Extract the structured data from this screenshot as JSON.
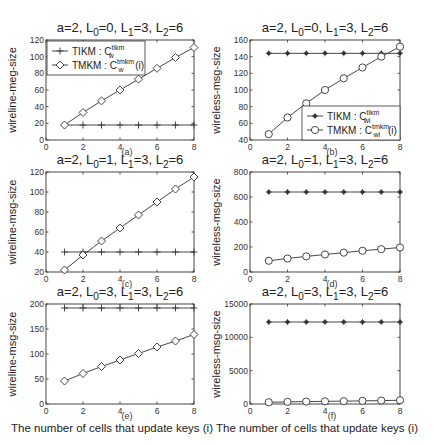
{
  "figure": {
    "xlabel": "The number of cells that update keys (i)"
  },
  "chart_data": [
    {
      "panel": "(a)",
      "type": "line",
      "title": "a=2, L0=0, L1=3, L2=6",
      "title_parts": {
        "a": "a=2, L",
        "s0": "0",
        "p0": "=0, L",
        "s1": "1",
        "p1": "=3, L",
        "s2": "2",
        "p2": "=6"
      },
      "xlabel": "",
      "ylabel": "wireline-meg-size",
      "x": [
        1,
        2,
        3,
        4,
        5,
        6,
        7,
        8
      ],
      "xlim": [
        0,
        8
      ],
      "ylim": [
        0,
        120
      ],
      "xticks": [
        0,
        2,
        4,
        6,
        8
      ],
      "yticks": [
        0,
        20,
        40,
        60,
        80,
        100,
        120
      ],
      "legend": {
        "position": "upper left",
        "entries": [
          "TIKM : C_w^tikm",
          "TMKM : C_w^tmkm(i)"
        ]
      },
      "series": [
        {
          "name": "TIKM : C_w^tikm",
          "marker": "plus",
          "values": [
            18,
            18,
            18,
            18,
            18,
            18,
            18,
            18
          ]
        },
        {
          "name": "TMKM : C_w^tmkm(i)",
          "marker": "diamond",
          "values": [
            18,
            33,
            47,
            60,
            73,
            86,
            99,
            111
          ]
        }
      ]
    },
    {
      "panel": "(b)",
      "type": "line",
      "title": "a=2, L0=0, L1=3, L2=6",
      "title_parts": {
        "a": "a=2, L",
        "s0": "0",
        "p0": "=0, L",
        "s1": "1",
        "p1": "=3, L",
        "s2": "2",
        "p2": "=6"
      },
      "xlabel": "",
      "ylabel": "wireless-msg-size",
      "x": [
        1,
        2,
        3,
        4,
        5,
        6,
        7,
        8
      ],
      "xlim": [
        0,
        8
      ],
      "ylim": [
        40,
        160
      ],
      "xticks": [
        0,
        2,
        4,
        6,
        8
      ],
      "yticks": [
        40,
        60,
        80,
        100,
        120,
        140,
        160
      ],
      "legend": {
        "position": "lower right",
        "entries": [
          "TIKM : C_wl^tikm",
          "TMKM : C_wl^tmkm(i)"
        ]
      },
      "series": [
        {
          "name": "TIKM : C_wl^tikm",
          "marker": "star",
          "values": [
            144,
            144,
            144,
            144,
            144,
            144,
            144,
            144
          ]
        },
        {
          "name": "TMKM : C_wl^tmkm(i)",
          "marker": "circle",
          "values": [
            47,
            67,
            84,
            100,
            114,
            127,
            140,
            152
          ]
        }
      ]
    },
    {
      "panel": "(c)",
      "type": "line",
      "title": "a=2, L0=1, L1=3, L2=6",
      "title_parts": {
        "a": "a=2, L",
        "s0": "0",
        "p0": "=1, L",
        "s1": "1",
        "p1": "=3, L",
        "s2": "2",
        "p2": "=6"
      },
      "xlabel": "",
      "ylabel": "wireline-msg-size",
      "x": [
        1,
        2,
        3,
        4,
        5,
        6,
        7,
        8
      ],
      "xlim": [
        0,
        8
      ],
      "ylim": [
        20,
        120
      ],
      "xticks": [
        0,
        2,
        4,
        6,
        8
      ],
      "yticks": [
        20,
        40,
        60,
        80,
        100,
        120
      ],
      "series": [
        {
          "name": "TIKM : C_w^tikm",
          "marker": "plus",
          "values": [
            40,
            40,
            40,
            40,
            40,
            40,
            40,
            40
          ]
        },
        {
          "name": "TMKM : C_w^tmkm(i)",
          "marker": "diamond",
          "values": [
            22,
            37,
            51,
            64,
            77,
            90,
            103,
            115
          ]
        }
      ]
    },
    {
      "panel": "(d)",
      "type": "line",
      "title": "a=2, L0=1, L1=3, L2=6",
      "title_parts": {
        "a": "a=2, L",
        "s0": "0",
        "p0": "=1, L",
        "s1": "1",
        "p1": "=3, L",
        "s2": "2",
        "p2": "=6"
      },
      "xlabel": "",
      "ylabel": "wireless-msg-size",
      "x": [
        1,
        2,
        3,
        4,
        5,
        6,
        7,
        8
      ],
      "xlim": [
        0,
        8
      ],
      "ylim": [
        0,
        800
      ],
      "xticks": [
        0,
        2,
        4,
        6,
        8
      ],
      "yticks": [
        0,
        200,
        400,
        600,
        800
      ],
      "series": [
        {
          "name": "TIKM : C_wl^tikm",
          "marker": "star",
          "values": [
            640,
            640,
            640,
            640,
            640,
            640,
            640,
            640
          ]
        },
        {
          "name": "TMKM : C_wl^tmkm(i)",
          "marker": "circle",
          "values": [
            90,
            108,
            125,
            140,
            155,
            170,
            183,
            196
          ]
        }
      ]
    },
    {
      "panel": "(e)",
      "type": "line",
      "title": "a=2, L0=3, L1=3, L2=6",
      "title_parts": {
        "a": "a=2, L",
        "s0": "0",
        "p0": "=3, L",
        "s1": "1",
        "p1": "=3, L",
        "s2": "2",
        "p2": "=6"
      },
      "xlabel": "The number of cells that update keys (i)",
      "ylabel": "wireline-msg-size",
      "x": [
        1,
        2,
        3,
        4,
        5,
        6,
        7,
        8
      ],
      "xlim": [
        0,
        8
      ],
      "ylim": [
        0,
        200
      ],
      "xticks": [
        0,
        2,
        4,
        6,
        8
      ],
      "yticks": [
        0,
        50,
        100,
        150,
        200
      ],
      "series": [
        {
          "name": "TIKM : C_w^tikm",
          "marker": "plus",
          "values": [
            192,
            192,
            192,
            192,
            192,
            192,
            192,
            192
          ]
        },
        {
          "name": "TMKM : C_w^tmkm(i)",
          "marker": "diamond",
          "values": [
            46,
            61,
            75,
            88,
            101,
            114,
            126,
            139
          ]
        }
      ]
    },
    {
      "panel": "(f)",
      "type": "line",
      "title": "a=2, L0=3, L1=3, L2=6",
      "title_parts": {
        "a": "a=2, L",
        "s0": "0",
        "p0": "=3, L",
        "s1": "1",
        "p1": "=3, L",
        "s2": "2",
        "p2": "=6"
      },
      "xlabel": "The number of cells that update keys (i)",
      "ylabel": "wireless-msg-size",
      "x": [
        1,
        2,
        3,
        4,
        5,
        6,
        7,
        8
      ],
      "xlim": [
        0,
        8
      ],
      "ylim": [
        0,
        15000
      ],
      "xticks": [
        0,
        2,
        4,
        6,
        8
      ],
      "yticks": [
        0,
        5000,
        10000,
        15000
      ],
      "series": [
        {
          "name": "TIKM : C_wl^tikm",
          "marker": "star",
          "values": [
            12300,
            12300,
            12300,
            12300,
            12300,
            12300,
            12300,
            12300
          ]
        },
        {
          "name": "TMKM : C_wl^tmkm(i)",
          "marker": "circle",
          "values": [
            260,
            320,
            360,
            400,
            430,
            470,
            510,
            560
          ]
        }
      ]
    }
  ]
}
